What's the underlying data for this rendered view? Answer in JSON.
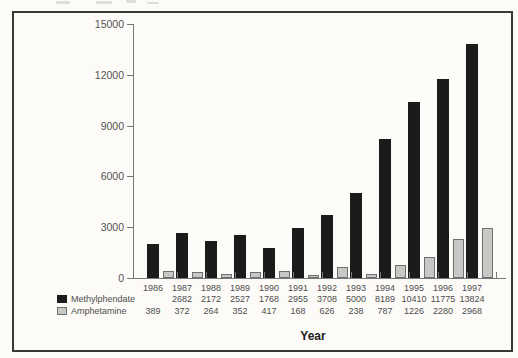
{
  "colors": {
    "background": "#fcfbf8",
    "frame_border": "#383838",
    "axis": "#777777",
    "tick_label_text": "#555555",
    "table_text": "#4d4d4d",
    "methylphendate_bar": "#1b1b1b",
    "amphetamine_bar_fill": "#c7c7c5",
    "amphetamine_bar_border": "#6f6f6f"
  },
  "chart_data": {
    "type": "bar",
    "title": "",
    "xlabel": "Year",
    "ylabel": "",
    "ylim": [
      0,
      15000
    ],
    "yticks": [
      0,
      3000,
      6000,
      9000,
      12000,
      15000
    ],
    "grid": false,
    "legend_position": "bottom-left",
    "categories": [
      "1986",
      "1987",
      "1988",
      "1989",
      "1990",
      "1991",
      "1992",
      "1993",
      "1994",
      "1995",
      "1996",
      "1997"
    ],
    "series": [
      {
        "name": "Methylphendate",
        "color": "#1b1b1b",
        "values": [
          2000,
          2682,
          2172,
          2527,
          1768,
          2955,
          3708,
          5000,
          8189,
          10410,
          11775,
          13824
        ],
        "value_labels": [
          "",
          "2682",
          "2172",
          "2527",
          "1768",
          "2955",
          "3708",
          "5000",
          "8189",
          "10410",
          "11775",
          "13824"
        ]
      },
      {
        "name": "Amphetamine",
        "color": "#c7c7c5",
        "border_color": "#6f6f6f",
        "values": [
          389,
          372,
          264,
          352,
          417,
          168,
          626,
          238,
          787,
          1226,
          2280,
          2968
        ],
        "value_labels": [
          "389",
          "372",
          "264",
          "352",
          "417",
          "168",
          "626",
          "238",
          "787",
          "1226",
          "2280",
          "2968"
        ]
      }
    ]
  }
}
